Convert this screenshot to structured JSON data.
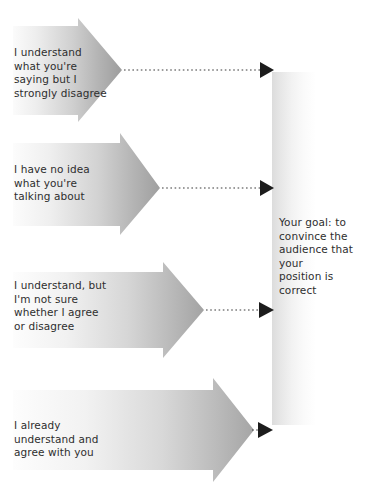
{
  "diagram": {
    "canvas": {
      "width": 384,
      "height": 496,
      "background": "#ffffff"
    },
    "colors": {
      "arrow_gradient_start": "#f7f7f7",
      "arrow_gradient_end": "#a6a6a6",
      "bar_gradient_start": "#e2e2e2",
      "bar_gradient_end": "#ffffff",
      "text": "#2e2e2e",
      "connector": "#3a3a3a"
    },
    "arrows": [
      {
        "id": "arrow-strongly-disagree",
        "label": "I understand\nwhat you're\nsaying but I\nstrongly disagree",
        "connector": "dotted-arrow"
      },
      {
        "id": "arrow-no-idea",
        "label": "I have no idea\nwhat you're\ntalking about",
        "connector": "dotted-arrow"
      },
      {
        "id": "arrow-not-sure",
        "label": "I understand, but\nI'm not sure\nwhether I agree\nor disagree",
        "connector": "dotted-arrow"
      },
      {
        "id": "arrow-already-agree",
        "label": "I already\nunderstand and\nagree with you",
        "connector": "dotted-arrow"
      }
    ],
    "goal": {
      "id": "goal-bar",
      "label": "Your goal: to\nconvince the\naudience that your\nposition is correct"
    }
  }
}
